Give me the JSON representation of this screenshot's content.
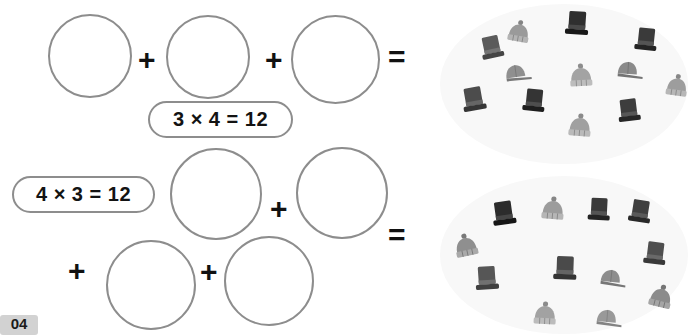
{
  "page": {
    "width": 691,
    "height": 335,
    "background": "#ffffff",
    "topic": "repeated addition and multiplication",
    "stroke_color": "#8d8d8d",
    "text_color": "#131313"
  },
  "rows": [
    {
      "id": "row-1",
      "equation_label": "3 × 4 = 12",
      "factor_groups": 3,
      "factor_per_group": 4,
      "product": 12,
      "operators": [
        "+",
        "+",
        "="
      ],
      "circles": [
        {
          "x": 48,
          "y": 14,
          "d": 84
        },
        {
          "x": 166,
          "y": 15,
          "d": 84
        },
        {
          "x": 291,
          "y": 15,
          "d": 89
        }
      ],
      "plus_positions": [
        {
          "x": 138,
          "y": 45
        },
        {
          "x": 265,
          "y": 45
        }
      ],
      "equals_position": {
        "x": 388,
        "y": 42
      },
      "pill_position": {
        "x": 148,
        "y": 101,
        "w": 145,
        "h": 37
      }
    },
    {
      "id": "row-2",
      "equation_label": "4 × 3 = 12",
      "factor_groups": 4,
      "factor_per_group": 3,
      "product": 12,
      "operators": [
        "+",
        "+",
        "+",
        "="
      ],
      "circles": [
        {
          "x": 170,
          "y": 148,
          "d": 92
        },
        {
          "x": 296,
          "y": 147,
          "d": 92
        },
        {
          "x": 106,
          "y": 240,
          "d": 90
        },
        {
          "x": 224,
          "y": 236,
          "d": 90
        }
      ],
      "plus_positions": [
        {
          "x": 68,
          "y": 256
        },
        {
          "x": 200,
          "y": 257
        },
        {
          "x": 270,
          "y": 194
        }
      ],
      "equals_position": {
        "x": 388,
        "y": 220
      },
      "pill_position": {
        "x": 12,
        "y": 176,
        "w": 143,
        "h": 37
      }
    }
  ],
  "clusters": [
    {
      "id": "cluster-top",
      "total_hats": 12,
      "answer_for_row": "row-1",
      "oval": {
        "x": 440,
        "y": 4,
        "w": 248,
        "h": 160
      },
      "hats": [
        {
          "type": "top-hat",
          "color": "#5b5b5b",
          "x": 477,
          "y": 34,
          "rot": -12,
          "scale": 1.0
        },
        {
          "type": "beanie",
          "color": "#9a9a9a",
          "x": 505,
          "y": 18,
          "rot": 10,
          "scale": 0.95
        },
        {
          "type": "top-hat",
          "color": "#2f2f2f",
          "x": 562,
          "y": 10,
          "rot": 4,
          "scale": 1.05
        },
        {
          "type": "top-hat",
          "color": "#3a3a3a",
          "x": 631,
          "y": 26,
          "rot": 6,
          "scale": 1.0
        },
        {
          "type": "cap",
          "color": "#8f8f8f",
          "x": 501,
          "y": 63,
          "rot": -8,
          "scale": 1.0
        },
        {
          "type": "beanie",
          "color": "#a3a3a3",
          "x": 567,
          "y": 62,
          "rot": -3,
          "scale": 1.0
        },
        {
          "type": "cap",
          "color": "#8a8a8a",
          "x": 613,
          "y": 60,
          "rot": 4,
          "scale": 1.0
        },
        {
          "type": "beanie",
          "color": "#9d9d9d",
          "x": 663,
          "y": 72,
          "rot": 8,
          "scale": 0.95
        },
        {
          "type": "top-hat",
          "color": "#4c4c4c",
          "x": 459,
          "y": 86,
          "rot": -10,
          "scale": 1.05
        },
        {
          "type": "top-hat",
          "color": "#343434",
          "x": 519,
          "y": 87,
          "rot": 6,
          "scale": 1.0
        },
        {
          "type": "top-hat",
          "color": "#3d3d3d",
          "x": 614,
          "y": 97,
          "rot": -7,
          "scale": 1.0
        },
        {
          "type": "beanie",
          "color": "#a0a0a0",
          "x": 566,
          "y": 112,
          "rot": 5,
          "scale": 1.0
        }
      ]
    },
    {
      "id": "cluster-bottom",
      "total_hats": 12,
      "answer_for_row": "row-2",
      "oval": {
        "x": 440,
        "y": 176,
        "w": 248,
        "h": 158
      },
      "hats": [
        {
          "type": "top-hat",
          "color": "#2c2c2c",
          "x": 489,
          "y": 200,
          "rot": -8,
          "scale": 1.05
        },
        {
          "type": "beanie",
          "color": "#9c9c9c",
          "x": 539,
          "y": 195,
          "rot": 5,
          "scale": 1.0
        },
        {
          "type": "top-hat",
          "color": "#3a3a3a",
          "x": 584,
          "y": 196,
          "rot": 3,
          "scale": 1.0
        },
        {
          "type": "top-hat",
          "color": "#3f3f3f",
          "x": 625,
          "y": 198,
          "rot": 9,
          "scale": 1.0
        },
        {
          "type": "beanie",
          "color": "#8f8f8f",
          "x": 452,
          "y": 232,
          "rot": -12,
          "scale": 1.0
        },
        {
          "type": "top-hat",
          "color": "#4f4f4f",
          "x": 640,
          "y": 240,
          "rot": 7,
          "scale": 1.0
        },
        {
          "type": "top-hat",
          "color": "#565656",
          "x": 472,
          "y": 265,
          "rot": -4,
          "scale": 1.05
        },
        {
          "type": "top-hat",
          "color": "#4a4a4a",
          "x": 550,
          "y": 255,
          "rot": 2,
          "scale": 1.05
        },
        {
          "type": "cap",
          "color": "#8d8d8d",
          "x": 596,
          "y": 268,
          "rot": 6,
          "scale": 1.0
        },
        {
          "type": "beanie",
          "color": "#8b8b8b",
          "x": 647,
          "y": 283,
          "rot": 14,
          "scale": 1.0
        },
        {
          "type": "beanie",
          "color": "#a2a2a2",
          "x": 531,
          "y": 300,
          "rot": 3,
          "scale": 1.0
        },
        {
          "type": "cap",
          "color": "#999999",
          "x": 592,
          "y": 308,
          "rot": 5,
          "scale": 1.0
        }
      ]
    }
  ],
  "badge": {
    "label": "04",
    "x": 0,
    "y": 315,
    "w": 38,
    "h": 20,
    "background": "#d2d2d2"
  }
}
